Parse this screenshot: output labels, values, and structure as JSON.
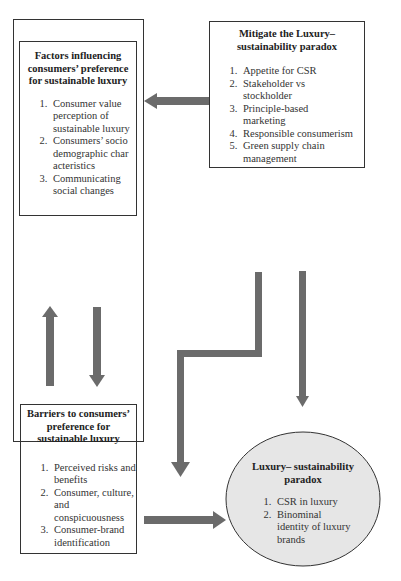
{
  "diagram": {
    "factors_box": {
      "title": "Factors influencing consumers’ preference for sustainable luxury",
      "items": [
        "Consumer value perception of sustainable luxury",
        "Consumers’ sociodemographic characteristics",
        "Communicating social changes"
      ]
    },
    "mitigate_box": {
      "title": "Mitigate the Luxury–sustainability paradox",
      "items": [
        "Appetite for CSR",
        "Stakeholder vs stockholder",
        "Principle-based marketing",
        "Responsible consumerism",
        "Green supply chain management"
      ]
    },
    "barriers_box": {
      "title": "Barriers to consumers’ preference for sustainable luxury",
      "items": [
        "Perceived risks and benefits",
        "Consumer, culture, and conspicuousness",
        "Consumer-brand identification"
      ]
    },
    "paradox_ellipse": {
      "title": "Luxury– sustainability paradox",
      "items": [
        "CSR in luxury",
        "Binominal identity of luxury brands"
      ]
    },
    "colors": {
      "arrow": "#6b6b6b",
      "ellipse_fill": "#e6e6e6",
      "border": "#333333"
    }
  }
}
